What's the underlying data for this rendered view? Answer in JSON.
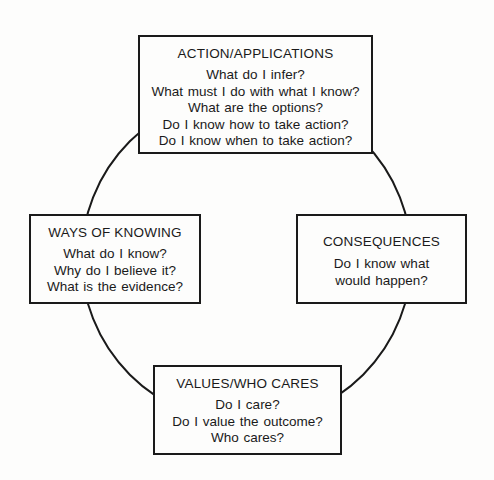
{
  "diagram": {
    "type": "cycle",
    "nodes": [
      {
        "id": "top",
        "title": "ACTION/APPLICATIONS",
        "questions": [
          "What do I infer?",
          "What must I do with what I know?",
          "What are the options?",
          "Do I know how to take action?",
          "Do I know when to take action?"
        ]
      },
      {
        "id": "left",
        "title": "WAYS OF KNOWING",
        "questions": [
          "What do I know?",
          "Why do I believe it?",
          "What is the evidence?"
        ]
      },
      {
        "id": "right",
        "title": "CONSEQUENCES",
        "questions": [
          "Do I know what",
          "would happen?"
        ]
      },
      {
        "id": "bottom",
        "title": "VALUES/WHO CARES",
        "questions": [
          "Do I care?",
          "Do I value the outcome?",
          "Who cares?"
        ]
      }
    ],
    "connector": "circle",
    "colors": {
      "line": "#1a1a1a",
      "background": "#fdfdfc"
    }
  }
}
